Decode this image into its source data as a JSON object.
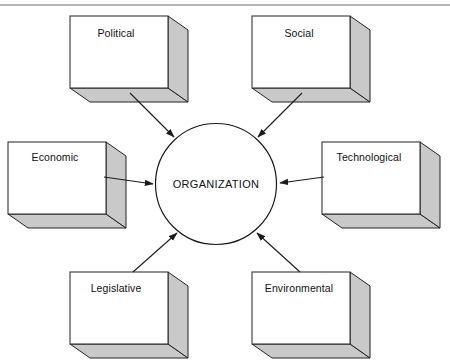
{
  "diagram": {
    "type": "influence-diagram",
    "center": {
      "label": "ORGANIZATION",
      "shape": "circle",
      "cx": 216,
      "cy": 184,
      "r": 60.5,
      "fill": "#ffffff",
      "stroke": "#1a1a1a"
    },
    "frame": {
      "top_rule": {
        "y": 5,
        "x1": 0,
        "x2": 450,
        "color": "#6e6e6e"
      }
    },
    "style": {
      "box_face_fill": "#ffffff",
      "box_side_fill": "#c9c9c9",
      "box_stroke": "#222222",
      "arrow_color": "#1a1a1a",
      "background": "#ffffff",
      "depth_x": 20,
      "depth_y": 14
    },
    "nodes": [
      {
        "id": "political",
        "label": "Political",
        "x": 70,
        "y": 16,
        "w": 98,
        "h": 72,
        "label_x": 116,
        "label_y": 34,
        "position": "top-left"
      },
      {
        "id": "social",
        "label": "Social",
        "x": 252,
        "y": 16,
        "w": 98,
        "h": 72,
        "label_x": 299,
        "label_y": 34,
        "position": "top-right"
      },
      {
        "id": "economic",
        "label": "Economic",
        "x": 8,
        "y": 142,
        "w": 98,
        "h": 72,
        "label_x": 55,
        "label_y": 158,
        "position": "left"
      },
      {
        "id": "technological",
        "label": "Technological",
        "x": 322,
        "y": 142,
        "w": 98,
        "h": 72,
        "label_x": 369,
        "label_y": 158,
        "position": "right"
      },
      {
        "id": "legislative",
        "label": "Legislative",
        "x": 70,
        "y": 272,
        "w": 98,
        "h": 72,
        "label_x": 116,
        "label_y": 289,
        "position": "bottom-left"
      },
      {
        "id": "environmental",
        "label": "Environmental",
        "x": 252,
        "y": 272,
        "w": 98,
        "h": 72,
        "label_x": 299,
        "label_y": 289,
        "position": "bottom-right"
      }
    ],
    "connections": [
      {
        "from": "political",
        "to": "center",
        "direction": "to-center",
        "x1": 130,
        "y1": 93,
        "x2": 174,
        "y2": 137
      },
      {
        "from": "social",
        "to": "center",
        "direction": "to-center",
        "x1": 302,
        "y1": 93,
        "x2": 258,
        "y2": 137
      },
      {
        "from": "economic",
        "to": "center",
        "direction": "to-center",
        "x1": 104,
        "y1": 177,
        "x2": 153,
        "y2": 184
      },
      {
        "from": "technological",
        "to": "center",
        "direction": "to-center",
        "x1": 324,
        "y1": 177,
        "x2": 280,
        "y2": 183
      },
      {
        "from": "legislative",
        "to": "center",
        "direction": "to-center",
        "x1": 133,
        "y1": 272,
        "x2": 177,
        "y2": 233
      },
      {
        "from": "environmental",
        "to": "center",
        "direction": "to-center",
        "x1": 300,
        "y1": 272,
        "x2": 257,
        "y2": 233
      }
    ]
  }
}
